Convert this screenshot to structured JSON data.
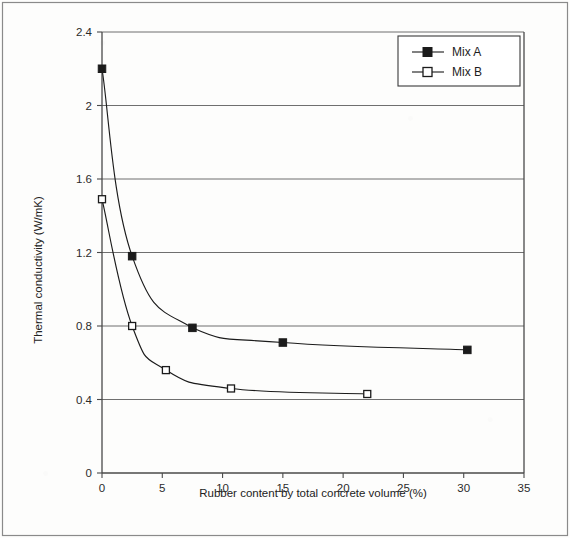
{
  "figure": {
    "background_color": "#fdfdfc",
    "frame_color": "#6d6d6d",
    "ink_color": "#2b2b2b"
  },
  "chart_data": {
    "type": "line",
    "title": "",
    "subtitle": "",
    "xlabel": "Rubber content by total concrete volume (%)",
    "ylabel": "Thermal conductivity (W/mK)",
    "xlim": [
      0,
      35
    ],
    "ylim": [
      0,
      2.4
    ],
    "xticks": [
      0,
      5,
      10,
      15,
      20,
      25,
      30,
      35
    ],
    "xtick_labels": [
      "0",
      "5",
      "10",
      "15",
      "20",
      "25",
      "30",
      "35"
    ],
    "yticks": [
      0,
      0.4,
      0.8,
      1.2,
      1.6,
      2,
      2.4
    ],
    "ytick_labels": [
      "0",
      "0.4",
      "0.8",
      "1.2",
      "1.6",
      "2",
      "2.4"
    ],
    "grid": "horizontal",
    "legend_position": "upper-right",
    "series": [
      {
        "name": "Mix A",
        "marker": "filled-square",
        "color": "#1b1b1b",
        "x": [
          0,
          2.5,
          7.5,
          15,
          30.3
        ],
        "y": [
          2.2,
          1.18,
          0.79,
          0.71,
          0.67
        ]
      },
      {
        "name": "Mix B",
        "marker": "open-square",
        "color": "#1b1b1b",
        "x": [
          0,
          2.5,
          5.3,
          10.7,
          22
        ],
        "y": [
          1.49,
          0.8,
          0.56,
          0.46,
          0.43
        ]
      }
    ]
  },
  "legend": {
    "entries": [
      {
        "label": "Mix A",
        "marker": "filled-square"
      },
      {
        "label": "Mix B",
        "marker": "open-square"
      }
    ]
  }
}
